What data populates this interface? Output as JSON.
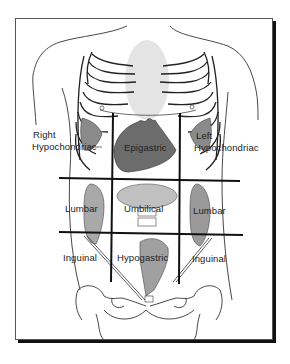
{
  "diagram": {
    "type": "anatomical-regions",
    "regions": {
      "right_hypochondriac": "Right\nHypochondriac",
      "right_hypochondriac_l1": "Right",
      "right_hypochondriac_l2": "Hypochondriac",
      "epigastric": "Epigastric",
      "left_hypochondriac_l1": "Left",
      "left_hypochondriac_l2": "Hypochondriac",
      "right_lumbar": "Lumbar",
      "umbilical": "Umbilical",
      "left_lumbar": "Lumbar",
      "right_inguinal": "Inguinal",
      "hypogastric": "Hypogastric",
      "left_inguinal": "Inguinal"
    },
    "grid": {
      "vertical_lines_x": [
        113,
        180
      ],
      "horizontal_lines_y": [
        179,
        233
      ],
      "line_color": "#111111"
    },
    "colors": {
      "frame_border": "#555555",
      "shadow": "#111111",
      "outline": "#333333",
      "organ_dark": "#6a6a6a",
      "organ_mid": "#9a9a9a",
      "organ_light": "#c8c8c8"
    }
  }
}
